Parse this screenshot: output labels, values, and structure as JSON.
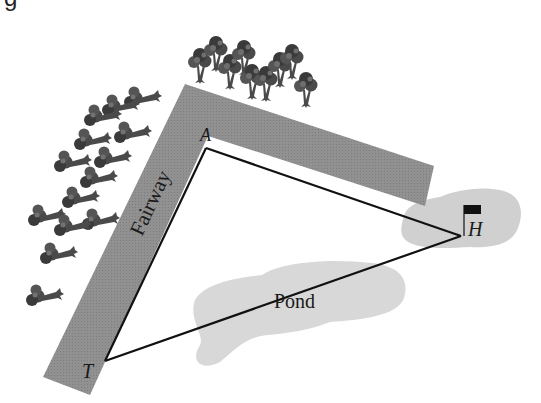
{
  "diagram": {
    "type": "golf-hole-triangle",
    "clipped_header_text": "g",
    "colors": {
      "fairway": "#8f8f8f",
      "fairway_edge": "#7a7a7a",
      "pond": "#d6d6d6",
      "green": "#cfcfcf",
      "line": "#111111",
      "tree_dark": "#3a3a3a",
      "tree_mid": "#6a6a6a",
      "flag": "#111111",
      "background": "#ffffff"
    },
    "labels": {
      "fairway": "Fairway",
      "pond": "Pond",
      "vertex_a": "A",
      "vertex_h": "H",
      "vertex_t": "T"
    },
    "vertices": {
      "A": [
        206,
        148
      ],
      "H": [
        461,
        236
      ],
      "T": [
        105,
        361
      ]
    },
    "segments": [
      {
        "from": "T",
        "to": "A"
      },
      {
        "from": "A",
        "to": "H"
      },
      {
        "from": "T",
        "to": "H"
      }
    ]
  }
}
